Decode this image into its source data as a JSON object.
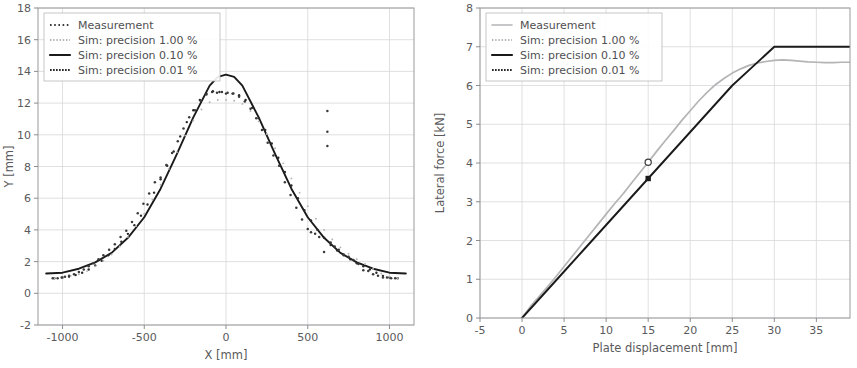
{
  "figure": {
    "panels": [
      "deformed-shape-plot",
      "force-displacement-plot"
    ]
  },
  "chart_data": [
    {
      "id": "left",
      "type": "scatter",
      "title": "",
      "xlabel": "X [mm]",
      "ylabel": "Y [mm]",
      "xlim": [
        -1150,
        1150
      ],
      "ylim": [
        -2,
        18
      ],
      "xticks": [
        -1000,
        -500,
        0,
        500,
        1000
      ],
      "xtick_labels": [
        "-1000",
        "-500",
        "0",
        "500",
        "1000"
      ],
      "yticks": [
        -2,
        0,
        2,
        4,
        6,
        8,
        10,
        12,
        14,
        16,
        18
      ],
      "ytick_labels": [
        "-2",
        "0",
        "2",
        "4",
        "6",
        "8",
        "10",
        "12",
        "14",
        "16",
        "18"
      ],
      "grid": true,
      "legend_position": "upper left",
      "legend_entries": [
        {
          "label": "Measurement",
          "style": "dotted-sparse",
          "color": "#3a3a3a"
        },
        {
          "label": "Sim: precision 1.00 %",
          "style": "dotted-light",
          "color": "#b4b4b6"
        },
        {
          "label": "Sim: precision 0.10 %",
          "style": "solid",
          "color": "#1a1a1a"
        },
        {
          "label": "Sim: precision 0.01 %",
          "style": "dotted-dense",
          "color": "#2a2a2a"
        }
      ],
      "series": [
        {
          "name": "Sim: precision 0.10 %",
          "style": "solid",
          "color": "#1a1a1a",
          "x": [
            -1100,
            -1000,
            -900,
            -800,
            -700,
            -600,
            -500,
            -400,
            -300,
            -200,
            -100,
            -50,
            0,
            50,
            100,
            200,
            300,
            400,
            500,
            600,
            700,
            800,
            900,
            1000,
            1100
          ],
          "y": [
            1.25,
            1.3,
            1.55,
            1.95,
            2.55,
            3.5,
            4.8,
            6.6,
            8.8,
            11.1,
            13.1,
            13.65,
            13.8,
            13.65,
            13.1,
            11.1,
            8.8,
            6.6,
            4.8,
            3.5,
            2.55,
            1.95,
            1.55,
            1.3,
            1.25
          ]
        },
        {
          "name": "Sim: precision 0.01 %",
          "style": "points-dense",
          "color": "#2a2a2a",
          "x": [
            -1050,
            -1000,
            -960,
            -920,
            -880,
            -840,
            -800,
            -760,
            -720,
            -680,
            -640,
            -600,
            -560,
            -520,
            -480,
            -440,
            -400,
            -360,
            -320,
            -280,
            -240,
            -200,
            -160,
            -120,
            -80,
            -40,
            0,
            40,
            80,
            120,
            160,
            200,
            240,
            280,
            320,
            360,
            400,
            440,
            480,
            520,
            560,
            600,
            640,
            680,
            720,
            760,
            800,
            840,
            880,
            920,
            960,
            1000,
            1050
          ],
          "y": [
            0.95,
            1.0,
            1.05,
            1.15,
            1.3,
            1.5,
            1.75,
            2.05,
            2.4,
            2.8,
            3.25,
            3.75,
            4.3,
            4.9,
            5.6,
            6.35,
            7.2,
            8.05,
            8.95,
            9.9,
            10.8,
            11.55,
            12.2,
            12.6,
            12.75,
            12.7,
            12.6,
            12.6,
            12.5,
            12.2,
            11.7,
            11.05,
            10.3,
            9.45,
            8.55,
            7.65,
            6.8,
            6.0,
            5.25,
            4.6,
            4.0,
            3.5,
            3.05,
            2.7,
            2.4,
            2.15,
            1.9,
            1.7,
            1.5,
            1.3,
            1.1,
            1.0,
            0.95
          ]
        },
        {
          "name": "Sim: precision 1.00 %",
          "style": "points-light",
          "color": "#b4b4b6",
          "x": [
            -1050,
            -1000,
            -950,
            -900,
            -850,
            -800,
            -750,
            -700,
            -650,
            -600,
            -550,
            -500,
            -450,
            -400,
            -350,
            -300,
            -250,
            -200,
            -150,
            -100,
            -50,
            0,
            50,
            100,
            150,
            200,
            250,
            300,
            350,
            400,
            450,
            500,
            550,
            600,
            650,
            700,
            750,
            800,
            850,
            900,
            950,
            1000,
            1050
          ],
          "y": [
            0.95,
            1.0,
            1.1,
            1.2,
            1.4,
            1.7,
            2.05,
            2.45,
            2.95,
            3.55,
            4.25,
            5.0,
            5.9,
            6.85,
            7.85,
            8.9,
            9.95,
            10.9,
            11.6,
            12.05,
            12.2,
            12.2,
            12.15,
            11.95,
            11.5,
            10.85,
            10.05,
            9.15,
            8.2,
            7.25,
            6.35,
            5.5,
            4.7,
            4.0,
            3.4,
            2.9,
            2.5,
            2.15,
            1.85,
            1.55,
            1.25,
            1.05,
            0.95
          ]
        },
        {
          "name": "Measurement",
          "style": "points-measure",
          "color": "#3a3a3a",
          "x": [
            -1060,
            -1030,
            -1005,
            -985,
            -960,
            -930,
            -900,
            -870,
            -840,
            -810,
            -780,
            -750,
            -715,
            -680,
            -645,
            -610,
            -575,
            -540,
            -505,
            -470,
            -435,
            -400,
            -365,
            -330,
            -295,
            -260,
            -225,
            -190,
            -155,
            -120,
            -85,
            -55,
            -25,
            10,
            45,
            80,
            115,
            150,
            185,
            220,
            255,
            290,
            325,
            360,
            395,
            430,
            465,
            500,
            520,
            545,
            570,
            600,
            620,
            620,
            620,
            640,
            665,
            690,
            720,
            750,
            780,
            810,
            840,
            870,
            900,
            930,
            960,
            985,
            1010,
            1035
          ],
          "y": [
            0.95,
            0.95,
            1.0,
            1.05,
            1.1,
            1.2,
            1.35,
            1.5,
            1.7,
            1.9,
            2.15,
            2.4,
            2.75,
            3.1,
            3.55,
            3.95,
            4.5,
            5.05,
            5.65,
            6.3,
            7.0,
            7.3,
            8.1,
            8.85,
            9.6,
            10.4,
            11.1,
            11.55,
            12.15,
            12.55,
            12.7,
            12.65,
            12.7,
            12.65,
            12.6,
            12.4,
            12.1,
            11.65,
            11.05,
            10.3,
            9.5,
            8.7,
            8.05,
            7.0,
            6.2,
            5.4,
            4.65,
            4.05,
            3.85,
            3.75,
            3.55,
            2.6,
            11.5,
            10.2,
            9.3,
            3.2,
            2.95,
            2.75,
            2.45,
            2.3,
            2.1,
            1.85,
            1.45,
            1.4,
            1.2,
            1.1,
            1.0,
            1.0,
            0.95,
            0.95
          ]
        }
      ]
    },
    {
      "id": "right",
      "type": "line",
      "title": "",
      "xlabel": "Plate displacement [mm]",
      "ylabel": "Lateral force [kN]",
      "xlim": [
        -5,
        39
      ],
      "ylim": [
        0,
        8
      ],
      "xticks": [
        -5,
        0,
        5,
        10,
        15,
        20,
        25,
        30,
        35
      ],
      "xtick_labels": [
        "-5",
        "0",
        "5",
        "10",
        "15",
        "20",
        "25",
        "30",
        "35"
      ],
      "yticks": [
        0,
        1,
        2,
        3,
        4,
        5,
        6,
        7,
        8
      ],
      "ytick_labels": [
        "0",
        "1",
        "2",
        "3",
        "4",
        "5",
        "6",
        "7",
        "8"
      ],
      "grid": true,
      "legend_position": "upper left",
      "legend_entries": [
        {
          "label": "Measurement",
          "style": "solid-light",
          "color": "#b4b4b6"
        },
        {
          "label": "Sim: precision 1.00 %",
          "style": "dotted-light",
          "color": "#b4b4b6"
        },
        {
          "label": "Sim: precision 0.10 %",
          "style": "solid",
          "color": "#1a1a1a"
        },
        {
          "label": "Sim: precision 0.01 %",
          "style": "dotted-dense",
          "color": "#2a2a2a"
        }
      ],
      "series": [
        {
          "name": "Measurement",
          "style": "solid-light",
          "color": "#b4b4b6",
          "x": [
            0,
            1,
            2,
            3,
            4,
            5,
            6,
            7,
            8,
            9,
            10,
            11,
            12,
            13,
            14,
            15,
            16,
            17,
            18,
            19,
            20,
            21,
            22,
            23,
            24,
            25,
            26,
            27,
            28,
            29,
            30,
            31,
            32,
            33,
            34,
            35,
            36,
            37,
            38,
            39
          ],
          "y": [
            0.0,
            0.3,
            0.55,
            0.8,
            1.06,
            1.33,
            1.6,
            1.87,
            2.14,
            2.41,
            2.68,
            2.95,
            3.2,
            3.48,
            3.75,
            4.02,
            4.3,
            4.57,
            4.83,
            5.1,
            5.35,
            5.6,
            5.82,
            6.02,
            6.18,
            6.32,
            6.43,
            6.52,
            6.58,
            6.62,
            6.65,
            6.66,
            6.65,
            6.63,
            6.61,
            6.6,
            6.59,
            6.59,
            6.6,
            6.6
          ]
        },
        {
          "name": "Sim: precision 0.10 %",
          "style": "solid",
          "color": "#1a1a1a",
          "x": [
            0,
            2.5,
            5,
            7.5,
            10,
            12.5,
            15,
            17.5,
            20,
            22.5,
            25,
            27.5,
            30,
            32.5,
            35,
            37.5,
            39
          ],
          "y": [
            0.0,
            0.6,
            1.2,
            1.8,
            2.4,
            3.0,
            3.6,
            4.2,
            4.8,
            5.4,
            6.0,
            6.5,
            7.0,
            7.0,
            7.0,
            7.0,
            7.0
          ]
        }
      ],
      "markers": [
        {
          "name": "measurement-marker",
          "x": 15,
          "y": 4.02,
          "shape": "open-circle",
          "color": "#3a3a3a"
        },
        {
          "name": "simulation-marker",
          "x": 15,
          "y": 3.6,
          "shape": "filled-square",
          "color": "#1a1a1a"
        }
      ]
    }
  ]
}
